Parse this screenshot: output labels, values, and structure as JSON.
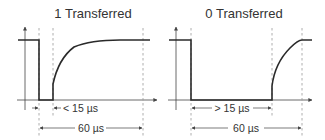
{
  "diagrams": [
    {
      "title": "1 Transferred",
      "short_label": "< 15 µs",
      "long_label": "60 µs"
    },
    {
      "title": "0 Transferred",
      "short_label": "> 15 µs",
      "long_label": "60 µs"
    }
  ],
  "colors": {
    "signal": "#2a2a2a",
    "guide": "#999999",
    "text": "#333333"
  }
}
